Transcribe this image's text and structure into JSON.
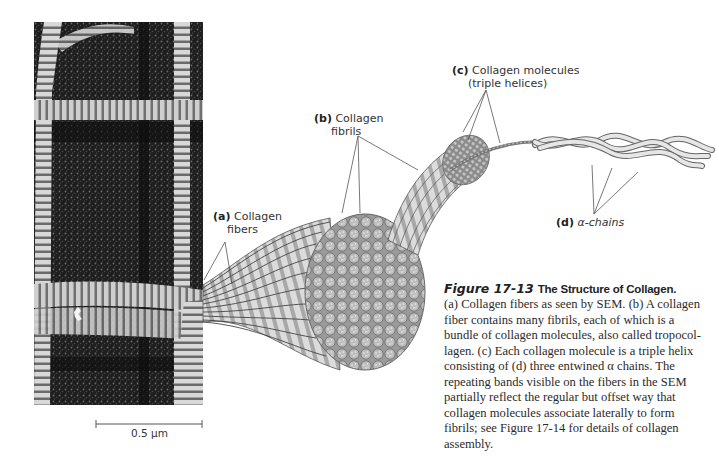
{
  "figure": {
    "sem_image": {
      "description": "Scanning electron micrograph of banded collagen fibers crossing in a grid pattern",
      "scale_bar_label": "0.5 μm"
    },
    "labels": {
      "a": {
        "letter": "(a)",
        "line1": "Collagen",
        "line2": "fibers"
      },
      "b": {
        "letter": "(b)",
        "line1": "Collagen",
        "line2": "fibrils"
      },
      "c": {
        "letter": "(c)",
        "line1": "Collagen molecules",
        "line2": "(triple helices)"
      },
      "d": {
        "letter": "(d)",
        "text": "α-chains"
      }
    },
    "caption": {
      "figure_number": "Figure 17-13",
      "title": "The Structure of Collagen.",
      "lines": [
        "(a) Collagen fibers as seen by SEM. (b) A collagen",
        "fiber contains many fibrils, each of which is a",
        "bundle of collagen molecules, also called tropocol-",
        "lagen. (c) Each collagen molecule is a triple helix",
        "consisting of (d) three entwined α chains. The",
        "repeating bands visible on the fibers in the SEM",
        "partially reflect the regular but offset way that",
        "collagen molecules associate laterally to form",
        "fibrils; see Figure 17-14 for details of collagen",
        "assembly."
      ]
    }
  }
}
